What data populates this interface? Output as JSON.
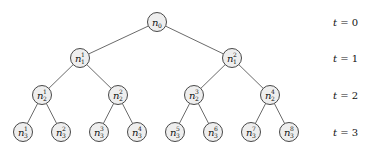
{
  "diagram": {
    "type": "binary-tree",
    "node_radius": 9.5,
    "colors": {
      "node_fill": "#eeeeee",
      "node_stroke": "#333333",
      "edge": "#444444",
      "text": "#111111"
    },
    "levels": [
      {
        "label": "t = 0",
        "var": "t",
        "value": "0",
        "y": 22
      },
      {
        "label": "t = 1",
        "var": "t",
        "value": "1",
        "y": 58
      },
      {
        "label": "t = 2",
        "var": "t",
        "value": "2",
        "y": 95
      },
      {
        "label": "t = 3",
        "var": "t",
        "value": "3",
        "y": 132
      }
    ],
    "level_label_x": 333,
    "nodes": [
      {
        "id": "n0",
        "base": "n",
        "sub": "0",
        "sup": "",
        "x": 157,
        "y": 22,
        "parent": null
      },
      {
        "id": "n1_1",
        "base": "n",
        "sub": "1",
        "sup": "1",
        "x": 80,
        "y": 58,
        "parent": "n0"
      },
      {
        "id": "n1_2",
        "base": "n",
        "sub": "1",
        "sup": "2",
        "x": 232,
        "y": 58,
        "parent": "n0"
      },
      {
        "id": "n2_1",
        "base": "n",
        "sub": "2",
        "sup": "1",
        "x": 42,
        "y": 95,
        "parent": "n1_1"
      },
      {
        "id": "n2_2",
        "base": "n",
        "sub": "2",
        "sup": "2",
        "x": 118,
        "y": 95,
        "parent": "n1_1"
      },
      {
        "id": "n2_3",
        "base": "n",
        "sub": "2",
        "sup": "3",
        "x": 194,
        "y": 95,
        "parent": "n1_2"
      },
      {
        "id": "n2_4",
        "base": "n",
        "sub": "2",
        "sup": "4",
        "x": 270,
        "y": 95,
        "parent": "n1_2"
      },
      {
        "id": "n3_1",
        "base": "n",
        "sub": "3",
        "sup": "1",
        "x": 23,
        "y": 132,
        "parent": "n2_1"
      },
      {
        "id": "n3_2",
        "base": "n",
        "sub": "3",
        "sup": "2",
        "x": 61,
        "y": 132,
        "parent": "n2_1"
      },
      {
        "id": "n3_3",
        "base": "n",
        "sub": "3",
        "sup": "3",
        "x": 99,
        "y": 132,
        "parent": "n2_2"
      },
      {
        "id": "n3_4",
        "base": "n",
        "sub": "3",
        "sup": "4",
        "x": 137,
        "y": 132,
        "parent": "n2_2"
      },
      {
        "id": "n3_5",
        "base": "n",
        "sub": "3",
        "sup": "5",
        "x": 175,
        "y": 132,
        "parent": "n2_3"
      },
      {
        "id": "n3_6",
        "base": "n",
        "sub": "3",
        "sup": "6",
        "x": 213,
        "y": 132,
        "parent": "n2_3"
      },
      {
        "id": "n3_7",
        "base": "n",
        "sub": "3",
        "sup": "7",
        "x": 251,
        "y": 132,
        "parent": "n2_4"
      },
      {
        "id": "n3_8",
        "base": "n",
        "sub": "3",
        "sup": "8",
        "x": 289,
        "y": 132,
        "parent": "n2_4"
      }
    ]
  }
}
